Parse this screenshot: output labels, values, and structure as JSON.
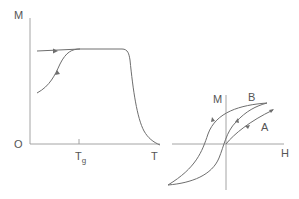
{
  "left_diagram": {
    "y_label": "M",
    "origin_label": "O",
    "tick_label": "T",
    "tick_subscript": "g",
    "x_label": "T"
  },
  "right_diagram": {
    "y_label": "M",
    "x_label": "H",
    "curve_a_label": "A",
    "curve_b_label": "B"
  },
  "colors": {
    "axis": "#9a9a9a",
    "curve": "#6e6e6e",
    "text": "#555555"
  }
}
